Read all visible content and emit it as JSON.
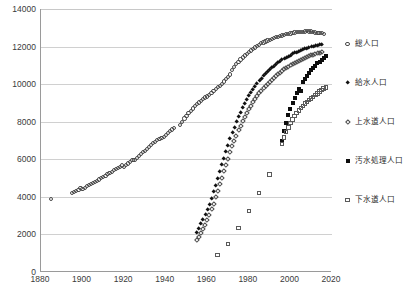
{
  "chart_data": {
    "type": "scatter",
    "title": "",
    "xlabel": "",
    "ylabel": "",
    "xlim": [
      1880,
      2020
    ],
    "ylim": [
      0,
      14000
    ],
    "xticks": [
      1880,
      1900,
      1920,
      1940,
      1960,
      1980,
      2000,
      2020
    ],
    "yticks": [
      0,
      2000,
      4000,
      6000,
      8000,
      10000,
      12000,
      14000
    ],
    "grid": "horizontal",
    "legend_position": "right",
    "series": [
      {
        "name": "総人口",
        "marker": "open-circle",
        "color": "#4a4a4a",
        "points": [
          [
            1885,
            3900
          ],
          [
            1895,
            4200
          ],
          [
            1896,
            4250
          ],
          [
            1897,
            4310
          ],
          [
            1898,
            4380
          ],
          [
            1899,
            4450
          ],
          [
            1900,
            4400
          ],
          [
            1901,
            4490
          ],
          [
            1902,
            4570
          ],
          [
            1903,
            4630
          ],
          [
            1904,
            4680
          ],
          [
            1905,
            4720
          ],
          [
            1906,
            4780
          ],
          [
            1907,
            4850
          ],
          [
            1908,
            4920
          ],
          [
            1909,
            4990
          ],
          [
            1910,
            5060
          ],
          [
            1911,
            5130
          ],
          [
            1912,
            5200
          ],
          [
            1913,
            5270
          ],
          [
            1914,
            5340
          ],
          [
            1915,
            5410
          ],
          [
            1916,
            5480
          ],
          [
            1917,
            5540
          ],
          [
            1918,
            5600
          ],
          [
            1919,
            5670
          ],
          [
            1920,
            5596
          ],
          [
            1921,
            5690
          ],
          [
            1922,
            5780
          ],
          [
            1923,
            5870
          ],
          [
            1924,
            5970
          ],
          [
            1925,
            5974
          ],
          [
            1926,
            6070
          ],
          [
            1927,
            6170
          ],
          [
            1928,
            6280
          ],
          [
            1929,
            6380
          ],
          [
            1930,
            6445
          ],
          [
            1931,
            6550
          ],
          [
            1932,
            6650
          ],
          [
            1933,
            6760
          ],
          [
            1934,
            6860
          ],
          [
            1935,
            6925
          ],
          [
            1936,
            7010
          ],
          [
            1937,
            7090
          ],
          [
            1938,
            7150
          ],
          [
            1939,
            7200
          ],
          [
            1940,
            7311
          ],
          [
            1941,
            7420
          ],
          [
            1942,
            7500
          ],
          [
            1943,
            7590
          ],
          [
            1944,
            7670
          ],
          [
            1947,
            7810
          ],
          [
            1948,
            8000
          ],
          [
            1949,
            8170
          ],
          [
            1950,
            8320
          ],
          [
            1951,
            8450
          ],
          [
            1952,
            8580
          ],
          [
            1953,
            8700
          ],
          [
            1954,
            8830
          ],
          [
            1955,
            8928
          ],
          [
            1956,
            9020
          ],
          [
            1957,
            9110
          ],
          [
            1958,
            9200
          ],
          [
            1959,
            9290
          ],
          [
            1960,
            9342
          ],
          [
            1961,
            9430
          ],
          [
            1962,
            9520
          ],
          [
            1963,
            9620
          ],
          [
            1964,
            9720
          ],
          [
            1965,
            9828
          ],
          [
            1966,
            9900
          ],
          [
            1967,
            10020
          ],
          [
            1968,
            10140
          ],
          [
            1969,
            10260
          ],
          [
            1970,
            10372
          ],
          [
            1971,
            10510
          ],
          [
            1972,
            10760
          ],
          [
            1973,
            10910
          ],
          [
            1974,
            11060
          ],
          [
            1975,
            11194
          ],
          [
            1976,
            11310
          ],
          [
            1977,
            11420
          ],
          [
            1978,
            11520
          ],
          [
            1979,
            11620
          ],
          [
            1980,
            11706
          ],
          [
            1981,
            11790
          ],
          [
            1982,
            11870
          ],
          [
            1983,
            11950
          ],
          [
            1984,
            12030
          ],
          [
            1985,
            12105
          ],
          [
            1986,
            12170
          ],
          [
            1987,
            12220
          ],
          [
            1988,
            12270
          ],
          [
            1989,
            12320
          ],
          [
            1990,
            12361
          ],
          [
            1991,
            12410
          ],
          [
            1992,
            12450
          ],
          [
            1993,
            12490
          ],
          [
            1994,
            12530
          ],
          [
            1995,
            12557
          ],
          [
            1996,
            12590
          ],
          [
            1997,
            12620
          ],
          [
            1998,
            12650
          ],
          [
            1999,
            12670
          ],
          [
            2000,
            12693
          ],
          [
            2001,
            12730
          ],
          [
            2002,
            12750
          ],
          [
            2003,
            12770
          ],
          [
            2004,
            12780
          ],
          [
            2005,
            12777
          ],
          [
            2006,
            12790
          ],
          [
            2007,
            12800
          ],
          [
            2008,
            12808
          ],
          [
            2009,
            12800
          ],
          [
            2010,
            12806
          ],
          [
            2011,
            12780
          ],
          [
            2012,
            12750
          ],
          [
            2013,
            12730
          ],
          [
            2014,
            12710
          ],
          [
            2015,
            12709
          ],
          [
            2016,
            12690
          ]
        ]
      },
      {
        "name": "給水人口",
        "marker": "filled-diamond",
        "color": "#111111",
        "points": [
          [
            1955,
            2100
          ],
          [
            1956,
            2300
          ],
          [
            1957,
            2550
          ],
          [
            1958,
            2800
          ],
          [
            1959,
            3050
          ],
          [
            1960,
            3300
          ],
          [
            1961,
            3600
          ],
          [
            1962,
            3900
          ],
          [
            1963,
            4250
          ],
          [
            1964,
            4600
          ],
          [
            1965,
            4980
          ],
          [
            1966,
            5350
          ],
          [
            1967,
            5700
          ],
          [
            1968,
            6050
          ],
          [
            1969,
            6400
          ],
          [
            1970,
            6750
          ],
          [
            1971,
            7100
          ],
          [
            1972,
            7420
          ],
          [
            1973,
            7700
          ],
          [
            1974,
            7980
          ],
          [
            1975,
            8250
          ],
          [
            1976,
            8500
          ],
          [
            1977,
            8740
          ],
          [
            1978,
            8960
          ],
          [
            1979,
            9170
          ],
          [
            1980,
            9370
          ],
          [
            1981,
            9560
          ],
          [
            1982,
            9730
          ],
          [
            1983,
            9890
          ],
          [
            1984,
            10040
          ],
          [
            1985,
            10180
          ],
          [
            1986,
            10310
          ],
          [
            1987,
            10430
          ],
          [
            1988,
            10550
          ],
          [
            1989,
            10660
          ],
          [
            1990,
            10760
          ],
          [
            1991,
            10860
          ],
          [
            1992,
            10950
          ],
          [
            1993,
            11040
          ],
          [
            1994,
            11120
          ],
          [
            1995,
            11200
          ],
          [
            1996,
            11280
          ],
          [
            1997,
            11350
          ],
          [
            1998,
            11420
          ],
          [
            1999,
            11480
          ],
          [
            2000,
            11540
          ],
          [
            2001,
            11600
          ],
          [
            2002,
            11650
          ],
          [
            2003,
            11700
          ],
          [
            2004,
            11750
          ],
          [
            2005,
            11790
          ],
          [
            2006,
            11830
          ],
          [
            2007,
            11870
          ],
          [
            2008,
            11910
          ],
          [
            2009,
            11940
          ],
          [
            2010,
            11970
          ],
          [
            2011,
            12000
          ],
          [
            2012,
            12030
          ],
          [
            2013,
            12060
          ],
          [
            2014,
            12080
          ],
          [
            2015,
            12100
          ]
        ]
      },
      {
        "name": "上水道人口",
        "marker": "open-diamond",
        "color": "#4a4a4a",
        "points": [
          [
            1955,
            1700
          ],
          [
            1956,
            1880
          ],
          [
            1957,
            2080
          ],
          [
            1958,
            2300
          ],
          [
            1959,
            2530
          ],
          [
            1960,
            2780
          ],
          [
            1961,
            3050
          ],
          [
            1962,
            3340
          ],
          [
            1963,
            3650
          ],
          [
            1964,
            3980
          ],
          [
            1965,
            4330
          ],
          [
            1966,
            4680
          ],
          [
            1967,
            5020
          ],
          [
            1968,
            5360
          ],
          [
            1969,
            5700
          ],
          [
            1970,
            6040
          ],
          [
            1971,
            6380
          ],
          [
            1972,
            6700
          ],
          [
            1973,
            6990
          ],
          [
            1974,
            7270
          ],
          [
            1975,
            7540
          ],
          [
            1976,
            7790
          ],
          [
            1977,
            8030
          ],
          [
            1978,
            8260
          ],
          [
            1979,
            8470
          ],
          [
            1980,
            8670
          ],
          [
            1981,
            8860
          ],
          [
            1982,
            9040
          ],
          [
            1983,
            9210
          ],
          [
            1984,
            9360
          ],
          [
            1985,
            9510
          ],
          [
            1986,
            9650
          ],
          [
            1987,
            9780
          ],
          [
            1988,
            9900
          ],
          [
            1989,
            10020
          ],
          [
            1990,
            10130
          ],
          [
            1991,
            10240
          ],
          [
            1992,
            10340
          ],
          [
            1993,
            10440
          ],
          [
            1994,
            10530
          ],
          [
            1995,
            10620
          ],
          [
            1996,
            10710
          ],
          [
            1997,
            10790
          ],
          [
            1998,
            10870
          ],
          [
            1999,
            10940
          ],
          [
            2000,
            11010
          ],
          [
            2001,
            11080
          ],
          [
            2002,
            11140
          ],
          [
            2003,
            11200
          ],
          [
            2004,
            11260
          ],
          [
            2005,
            11310
          ],
          [
            2006,
            11360
          ],
          [
            2007,
            11410
          ],
          [
            2008,
            11460
          ],
          [
            2009,
            11500
          ],
          [
            2010,
            11540
          ],
          [
            2011,
            11580
          ],
          [
            2012,
            11610
          ],
          [
            2013,
            11650
          ],
          [
            2014,
            11680
          ],
          [
            2015,
            11710
          ]
        ]
      },
      {
        "name": "汚水処理人口",
        "marker": "filled-square",
        "color": "#0d0d0d",
        "points": [
          [
            1996,
            7000
          ],
          [
            1997,
            7500
          ],
          [
            1998,
            7950
          ],
          [
            1999,
            8350
          ],
          [
            2000,
            8700
          ],
          [
            2001,
            9000
          ],
          [
            2002,
            9280
          ],
          [
            2003,
            9520
          ],
          [
            2004,
            9740
          ],
          [
            2005,
            9650
          ],
          [
            2006,
            10100
          ],
          [
            2007,
            10280
          ],
          [
            2008,
            10450
          ],
          [
            2009,
            10600
          ],
          [
            2010,
            10740
          ],
          [
            2011,
            10870
          ],
          [
            2012,
            10990
          ],
          [
            2013,
            11100
          ],
          [
            2014,
            11200
          ],
          [
            2015,
            11300
          ],
          [
            2016,
            11400
          ],
          [
            2017,
            11480
          ]
        ]
      },
      {
        "name": "下水道人口",
        "marker": "open-square",
        "color": "#5a5a5a",
        "points": [
          [
            1965,
            900
          ],
          [
            1970,
            1500
          ],
          [
            1975,
            2350
          ],
          [
            1980,
            3250
          ],
          [
            1985,
            4200
          ],
          [
            1990,
            5200
          ],
          [
            1996,
            6800
          ],
          [
            1997,
            7150
          ],
          [
            1998,
            7450
          ],
          [
            1999,
            7700
          ],
          [
            2000,
            7920
          ],
          [
            2001,
            8120
          ],
          [
            2002,
            8300
          ],
          [
            2003,
            8460
          ],
          [
            2004,
            8600
          ],
          [
            2005,
            8730
          ],
          [
            2006,
            8850
          ],
          [
            2007,
            8960
          ],
          [
            2008,
            9060
          ],
          [
            2009,
            9150
          ],
          [
            2010,
            9240
          ],
          [
            2011,
            9330
          ],
          [
            2012,
            9420
          ],
          [
            2013,
            9510
          ],
          [
            2014,
            9600
          ],
          [
            2015,
            9680
          ],
          [
            2016,
            9760
          ],
          [
            2017,
            9830
          ]
        ]
      }
    ]
  },
  "legend": {
    "items": [
      {
        "label": "総人口",
        "marker": "open-circle"
      },
      {
        "label": "給水人口",
        "marker": "filled-diamond"
      },
      {
        "label": "上水道人口",
        "marker": "open-diamond"
      },
      {
        "label": "汚水処理人口",
        "marker": "filled-square"
      },
      {
        "label": "下水道人口",
        "marker": "open-square"
      }
    ]
  }
}
